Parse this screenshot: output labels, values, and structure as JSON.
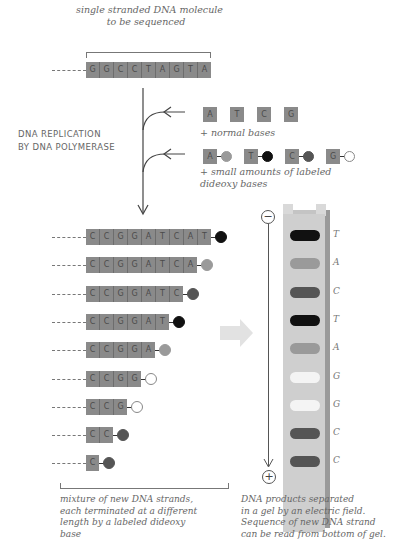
{
  "template": {
    "caption_line1": "single stranded DNA molecule",
    "caption_line2": "to be sequenced",
    "bases": [
      "G",
      "G",
      "C",
      "C",
      "T",
      "A",
      "G",
      "T",
      "A"
    ]
  },
  "process_label": {
    "line1": "DNA REPLICATION",
    "line2": "BY DNA POLYMERASE"
  },
  "normal_bases": {
    "bases": [
      "A",
      "T",
      "C",
      "G"
    ],
    "caption": "+ normal bases"
  },
  "dideoxy_bases": {
    "items": [
      {
        "base": "A",
        "label_color": "#9a9a9a"
      },
      {
        "base": "T",
        "label_color": "#111111"
      },
      {
        "base": "C",
        "label_color": "#555555"
      },
      {
        "base": "G",
        "label_color": "#ffffff"
      }
    ],
    "caption_line1": "+ small amounts of labeled",
    "caption_line2": "dideoxy bases"
  },
  "fragments": [
    {
      "bases": [
        "C",
        "C",
        "G",
        "G",
        "A",
        "T",
        "C",
        "A",
        "T"
      ],
      "label_color": "#111111"
    },
    {
      "bases": [
        "C",
        "C",
        "G",
        "G",
        "A",
        "T",
        "C",
        "A"
      ],
      "label_color": "#9a9a9a"
    },
    {
      "bases": [
        "C",
        "C",
        "G",
        "G",
        "A",
        "T",
        "C"
      ],
      "label_color": "#555555"
    },
    {
      "bases": [
        "C",
        "C",
        "G",
        "G",
        "A",
        "T"
      ],
      "label_color": "#111111"
    },
    {
      "bases": [
        "C",
        "C",
        "G",
        "G",
        "A"
      ],
      "label_color": "#9a9a9a"
    },
    {
      "bases": [
        "C",
        "C",
        "G",
        "G"
      ],
      "label_color": "#ffffff"
    },
    {
      "bases": [
        "C",
        "C",
        "G"
      ],
      "label_color": "#ffffff"
    },
    {
      "bases": [
        "C",
        "C"
      ],
      "label_color": "#555555"
    },
    {
      "bases": [
        "C"
      ],
      "label_color": "#555555"
    }
  ],
  "gel": {
    "negative_symbol": "−",
    "positive_symbol": "+",
    "bands": [
      {
        "base": "T",
        "color": "#111111"
      },
      {
        "base": "A",
        "color": "#9a9a9a"
      },
      {
        "base": "C",
        "color": "#555555"
      },
      {
        "base": "T",
        "color": "#111111"
      },
      {
        "base": "A",
        "color": "#9a9a9a"
      },
      {
        "base": "G",
        "color": "#f4f4f4"
      },
      {
        "base": "G",
        "color": "#f4f4f4"
      },
      {
        "base": "C",
        "color": "#555555"
      },
      {
        "base": "C",
        "color": "#555555"
      }
    ]
  },
  "captions": {
    "left": [
      "mixture of new DNA strands,",
      "each terminated at a different",
      "length by a labeled dideoxy",
      "base"
    ],
    "right": [
      "DNA products separated",
      "in a gel by an electric field.",
      "Sequence of new DNA strand",
      "can be read from bottom of gel."
    ]
  }
}
